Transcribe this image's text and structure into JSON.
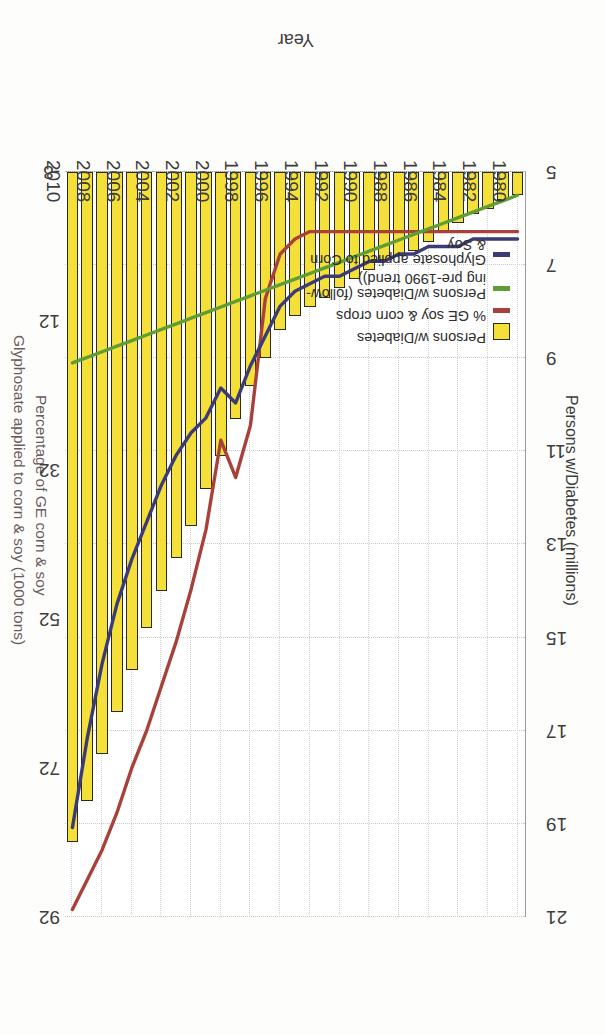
{
  "chart_data": {
    "type": "bar",
    "title": "",
    "xlabel": "Year",
    "ylabel": "Persons w/Diabetes (millions)",
    "y2label_top": "Glyphosate applied to corn & soy (1000 tons)",
    "y2label_bottom": "Percentage of GE corn & soy",
    "ylim": [
      5,
      21
    ],
    "yticks": [
      5,
      7,
      9,
      11,
      13,
      15,
      17,
      19,
      21
    ],
    "y2lim": [
      -8,
      92
    ],
    "y2ticks": [
      -8,
      12,
      32,
      52,
      72,
      92
    ],
    "xlim": [
      1980,
      2010
    ],
    "xticks": [
      1980,
      1982,
      1984,
      1986,
      1988,
      1990,
      1992,
      1994,
      1996,
      1998,
      2000,
      2002,
      2004,
      2006,
      2008,
      2010
    ],
    "grid": true,
    "legend_position": "inside-left",
    "categories": [
      1980,
      1981,
      1982,
      1983,
      1984,
      1985,
      1986,
      1987,
      1988,
      1989,
      1990,
      1991,
      1992,
      1993,
      1994,
      1995,
      1996,
      1997,
      1998,
      1999,
      2000,
      2001,
      2002,
      2003,
      2004,
      2005,
      2006,
      2007,
      2008,
      2009,
      2010
    ],
    "series": [
      {
        "name": "Persons w/Diabetes",
        "color": "#f5e03a",
        "axis": "left",
        "unit": "millions",
        "render": "bar",
        "values": [
          5.5,
          5.6,
          5.8,
          5.9,
          6.1,
          6.3,
          6.5,
          6.7,
          6.8,
          6.9,
          7.1,
          7.3,
          7.5,
          7.7,
          7.9,
          8.1,
          8.4,
          9.0,
          9.6,
          10.3,
          11.1,
          11.8,
          12.6,
          13.3,
          14.0,
          14.8,
          15.7,
          16.6,
          17.5,
          18.5,
          19.4
        ]
      },
      {
        "name": "% GE soy & corn crops",
        "color": "#a8413a",
        "axis": "right",
        "unit": "percent",
        "render": "line",
        "values": [
          0,
          0,
          0,
          0,
          0,
          0,
          0,
          0,
          0,
          0,
          0,
          0,
          0,
          0,
          0,
          1,
          3,
          9,
          26,
          33,
          28,
          40,
          48,
          55,
          61,
          67,
          72,
          78,
          83,
          87,
          91
        ]
      },
      {
        "name": "Persons w/Diabetes (following pre-1990 trend))",
        "color": "#5f9e35",
        "axis": "left",
        "unit": "millions",
        "render": "line",
        "values": [
          5.5,
          5.62,
          5.74,
          5.86,
          5.98,
          6.1,
          6.22,
          6.34,
          6.46,
          6.58,
          6.7,
          6.82,
          6.94,
          7.06,
          7.18,
          7.3,
          7.42,
          7.54,
          7.66,
          7.78,
          7.9,
          8.02,
          8.14,
          8.26,
          8.38,
          8.5,
          8.62,
          8.74,
          8.86,
          8.98,
          9.1
        ]
      },
      {
        "name": "Glyphosate applied to Corn & Soy",
        "color": "#3b3b77",
        "axis": "right",
        "unit": "1000 tons",
        "render": "line",
        "values": [
          1,
          1,
          1,
          1,
          2,
          2,
          2,
          3,
          3,
          4,
          4,
          5,
          6,
          6,
          7,
          8,
          10,
          14,
          18,
          23,
          21,
          25,
          27,
          30,
          34,
          39,
          44,
          50,
          58,
          68,
          80
        ]
      }
    ],
    "legend": [
      {
        "label": "Persons w/Diabetes",
        "marker": "box",
        "color": "#f5e03a"
      },
      {
        "label": "% GE soy & corn crops",
        "marker": "line",
        "color": "#a8413a"
      },
      {
        "label": "Persons w/Diabetes (follow-\ning pre-1990 trend))",
        "marker": "line",
        "color": "#5f9e35"
      },
      {
        "label": "Glyphosate applied to Corn\n& Soy",
        "marker": "line",
        "color": "#3b3b77"
      }
    ]
  }
}
